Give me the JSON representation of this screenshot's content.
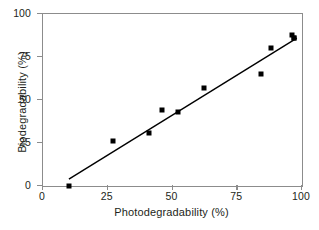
{
  "chart_data": {
    "type": "scatter",
    "title": "",
    "xlabel": "Photodegradability (%)",
    "ylabel": "Biodegradability (%)",
    "xlim": [
      0,
      100
    ],
    "ylim": [
      0,
      100
    ],
    "xticks": [
      0,
      25,
      50,
      75,
      100
    ],
    "yticks": [
      0,
      25,
      50,
      75,
      100
    ],
    "xtick_labels": [
      "0",
      "25",
      "50",
      "75",
      "100"
    ],
    "ytick_labels": [
      "0",
      "25",
      "50",
      "75",
      "100"
    ],
    "grid": false,
    "legend": null,
    "marker": "filled-square",
    "marker_color": "#000000",
    "points": [
      {
        "x": 10,
        "y": 0
      },
      {
        "x": 27,
        "y": 26
      },
      {
        "x": 41,
        "y": 31
      },
      {
        "x": 46,
        "y": 44
      },
      {
        "x": 52,
        "y": 43
      },
      {
        "x": 62,
        "y": 57
      },
      {
        "x": 84,
        "y": 65
      },
      {
        "x": 88,
        "y": 80
      },
      {
        "x": 96,
        "y": 88
      },
      {
        "x": 97,
        "y": 86
      },
      {
        "x": 97,
        "y": 86
      }
    ],
    "trendline": {
      "type": "linear-fit",
      "color": "#000000",
      "x_start": 10,
      "y_start": 4,
      "x_end": 98,
      "y_end": 86
    }
  },
  "figure": {
    "frame_color": "#8c8c8c",
    "background": "#ffffff"
  }
}
